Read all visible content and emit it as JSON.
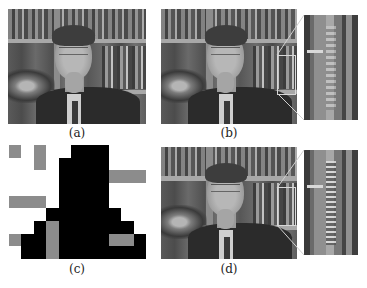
{
  "figure": {
    "panels": [
      {
        "id": "a",
        "caption": "(a)",
        "content": "video frame of man in suit in front of bookshelf"
      },
      {
        "id": "b",
        "caption": "(b)",
        "content": "video frame with magnified inset of bookshelf spine region"
      },
      {
        "id": "c",
        "caption": "(c)",
        "content": "block map of regions (black, gray, white)"
      },
      {
        "id": "d",
        "caption": "(d)",
        "content": "video frame with magnified inset of bookshelf spine region"
      }
    ],
    "block_map": {
      "columns": 11,
      "rows": 9,
      "legend": {
        "B": "#000000",
        "G": "#8c8c8c",
        ".": "#ffffff"
      },
      "cells": [
        "G.G..BBB...",
        "..G.BBBB...",
        "....BBBBGGG",
        "....BBBB...",
        "GGG.BBBB...",
        "...BBBBBB..",
        "..BGBBBBBB.",
        "GBBGBBBBGGB",
        ".BBGBBBBBBB"
      ]
    }
  }
}
